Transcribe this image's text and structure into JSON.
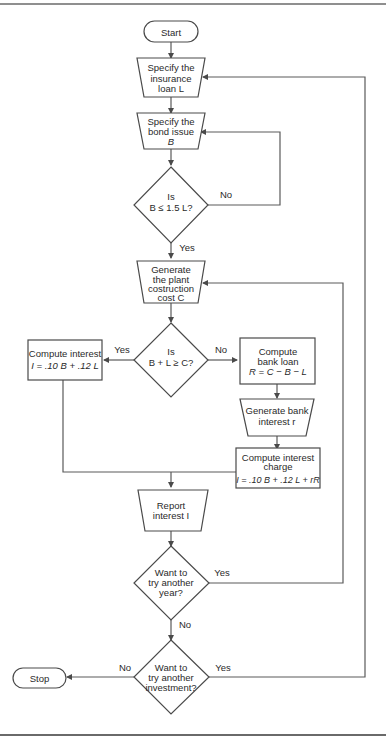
{
  "flowchart": {
    "nodes": {
      "start": {
        "type": "terminal",
        "label": "Start"
      },
      "specify_loan": {
        "type": "input",
        "lines": [
          "Specify the",
          "insurance",
          "loan L"
        ]
      },
      "specify_bond": {
        "type": "input",
        "lines": [
          "Specify the",
          "bond issue",
          "B"
        ]
      },
      "check_bond": {
        "type": "decision",
        "lines": [
          "Is",
          "B ≤ 1.5 L?"
        ]
      },
      "generate_cost": {
        "type": "input",
        "lines": [
          "Generate",
          "the plant",
          "costruction",
          "cost C"
        ]
      },
      "check_sum": {
        "type": "decision",
        "lines": [
          "Is",
          "B + L ≥ C?"
        ]
      },
      "compute_interest_simple": {
        "type": "process",
        "lines": [
          "Compute interest",
          "I = .10 B + .12 L"
        ]
      },
      "compute_bank_loan": {
        "type": "process",
        "lines": [
          "Compute",
          "bank loan",
          "R = C − B − L"
        ]
      },
      "generate_bank_interest": {
        "type": "input",
        "lines": [
          "Generate bank",
          "interest r"
        ]
      },
      "compute_interest_charge": {
        "type": "process",
        "lines": [
          "Compute interest",
          "charge",
          "I = .10 B + .12 L + rR"
        ]
      },
      "report_interest": {
        "type": "input",
        "lines": [
          "Report",
          "interest I"
        ]
      },
      "another_year": {
        "type": "decision",
        "lines": [
          "Want to",
          "try another",
          "year?"
        ]
      },
      "another_investment": {
        "type": "decision",
        "lines": [
          "Want to",
          "try another",
          "investment?"
        ]
      },
      "stop": {
        "type": "terminal",
        "label": "Stop"
      }
    },
    "edge_labels": {
      "check_bond_no": "No",
      "check_bond_yes": "Yes",
      "check_sum_yes": "Yes",
      "check_sum_no": "No",
      "another_year_yes": "Yes",
      "another_year_no": "No",
      "another_investment_no": "No",
      "another_investment_yes": "Yes"
    },
    "edges": [
      [
        "start",
        "specify_loan"
      ],
      [
        "specify_loan",
        "specify_bond"
      ],
      [
        "specify_bond",
        "check_bond"
      ],
      [
        "check_bond",
        "specify_bond",
        "No"
      ],
      [
        "check_bond",
        "generate_cost",
        "Yes"
      ],
      [
        "generate_cost",
        "check_sum"
      ],
      [
        "check_sum",
        "compute_interest_simple",
        "Yes"
      ],
      [
        "check_sum",
        "compute_bank_loan",
        "No"
      ],
      [
        "compute_bank_loan",
        "generate_bank_interest"
      ],
      [
        "generate_bank_interest",
        "compute_interest_charge"
      ],
      [
        "compute_interest_simple",
        "report_interest"
      ],
      [
        "compute_interest_charge",
        "report_interest"
      ],
      [
        "report_interest",
        "another_year"
      ],
      [
        "another_year",
        "generate_cost",
        "Yes"
      ],
      [
        "another_year",
        "another_investment",
        "No"
      ],
      [
        "another_investment",
        "stop",
        "No"
      ],
      [
        "another_investment",
        "specify_loan",
        "Yes"
      ]
    ]
  }
}
